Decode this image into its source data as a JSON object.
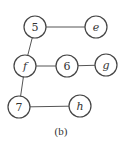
{
  "diagram": {
    "caption": "(b)",
    "nodes": [
      {
        "id": "5",
        "label": "5",
        "italic": false
      },
      {
        "id": "e",
        "label": "e",
        "italic": true
      },
      {
        "id": "f",
        "label": "f",
        "italic": true
      },
      {
        "id": "6",
        "label": "6",
        "italic": false
      },
      {
        "id": "g",
        "label": "g",
        "italic": true
      },
      {
        "id": "7",
        "label": "7",
        "italic": false
      },
      {
        "id": "h",
        "label": "h",
        "italic": true
      }
    ],
    "edges": [
      {
        "from": "5",
        "to": "e"
      },
      {
        "from": "5",
        "to": "f"
      },
      {
        "from": "f",
        "to": "6"
      },
      {
        "from": "6",
        "to": "g"
      },
      {
        "from": "f",
        "to": "7"
      },
      {
        "from": "7",
        "to": "h"
      }
    ]
  }
}
